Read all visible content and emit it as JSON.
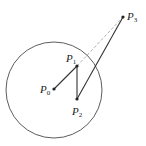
{
  "diagram": {
    "colors": {
      "stroke": "#333333",
      "dashed": "#999999",
      "background": "#ffffff"
    },
    "circle": {
      "cx": 54,
      "cy": 90,
      "r": 48
    },
    "points": [
      {
        "id": "P0",
        "label": "P",
        "sub": "0",
        "x": 54,
        "y": 89,
        "lx": 40,
        "ly": 93
      },
      {
        "id": "P1",
        "label": "P",
        "sub": "1",
        "x": 77,
        "y": 66,
        "lx": 66,
        "ly": 62
      },
      {
        "id": "P2",
        "label": "P",
        "sub": "2",
        "x": 77,
        "y": 99,
        "lx": 72,
        "ly": 115
      },
      {
        "id": "P3",
        "label": "P",
        "sub": "3",
        "x": 123,
        "y": 17,
        "lx": 127,
        "ly": 20
      }
    ],
    "segments": [
      {
        "from": "P0",
        "to": "P1",
        "style": "solid"
      },
      {
        "from": "P1",
        "to": "P2",
        "style": "solid"
      },
      {
        "from": "P2",
        "to": "P3",
        "style": "solid"
      },
      {
        "from": "P1",
        "to": "P3",
        "style": "dashed"
      }
    ]
  }
}
